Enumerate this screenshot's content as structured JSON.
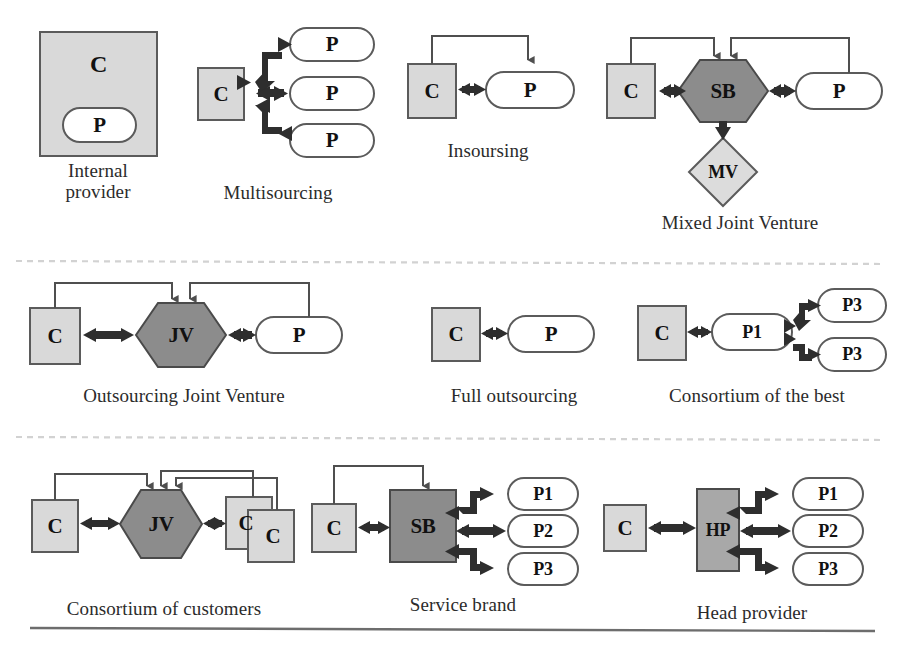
{
  "figure": {
    "title_visible": false,
    "background": "#ffffff",
    "separator_color": "#cfcfcf",
    "rule_color": "#6d6d6d"
  },
  "palette": {
    "customer_fill": "#d9d9d9",
    "provider_fill": "#ffffff",
    "joint_fill": "#8c8c8c",
    "mv_fill": "#dcdcdc",
    "stroke": "#4a4a4a",
    "arrow_thick": "#2e2e2e",
    "arrow_thin": "#5a5a5a",
    "text": "#111111",
    "caption_text": "#2b2b2b"
  },
  "legend": {
    "C": "Customer",
    "P": "Provider",
    "JV": "Joint Venture",
    "SB": "Service Brand",
    "HP": "Head Provider",
    "MV": "Mixed Venture"
  },
  "rows": [
    {
      "id": "row-1",
      "models": [
        {
          "id": "internal-provider",
          "caption": "Internal\nprovider",
          "nodes": [
            {
              "id": "ip-c",
              "label": "C",
              "shape": "square",
              "fill": "customer"
            },
            {
              "id": "ip-p",
              "label": "P",
              "shape": "rounded",
              "fill": "provider"
            }
          ]
        },
        {
          "id": "multisourcing",
          "caption": "Multisourcing",
          "nodes": [
            {
              "id": "ms-c",
              "label": "C",
              "shape": "square",
              "fill": "customer"
            },
            {
              "id": "ms-p1",
              "label": "P",
              "shape": "rounded",
              "fill": "provider"
            },
            {
              "id": "ms-p2",
              "label": "P",
              "shape": "rounded",
              "fill": "provider"
            },
            {
              "id": "ms-p3",
              "label": "P",
              "shape": "rounded",
              "fill": "provider"
            }
          ]
        },
        {
          "id": "insoursing",
          "caption": "Insoursing",
          "nodes": [
            {
              "id": "is-c",
              "label": "C",
              "shape": "square",
              "fill": "customer"
            },
            {
              "id": "is-p",
              "label": "P",
              "shape": "rounded",
              "fill": "provider"
            }
          ]
        },
        {
          "id": "mixed-joint-venture",
          "caption": "Mixed Joint Venture",
          "nodes": [
            {
              "id": "mjv-c",
              "label": "C",
              "shape": "square",
              "fill": "customer"
            },
            {
              "id": "mjv-sb",
              "label": "SB",
              "shape": "hexagon",
              "fill": "joint"
            },
            {
              "id": "mjv-p",
              "label": "P",
              "shape": "rounded",
              "fill": "provider"
            },
            {
              "id": "mjv-mv",
              "label": "MV",
              "shape": "diamond",
              "fill": "mv"
            }
          ]
        }
      ]
    },
    {
      "id": "row-2",
      "models": [
        {
          "id": "outsourcing-joint-venture",
          "caption": "Outsourcing Joint Venture",
          "nodes": [
            {
              "id": "ojv-c",
              "label": "C",
              "shape": "square",
              "fill": "customer"
            },
            {
              "id": "ojv-jv",
              "label": "JV",
              "shape": "hexagon",
              "fill": "joint"
            },
            {
              "id": "ojv-p",
              "label": "P",
              "shape": "rounded",
              "fill": "provider"
            }
          ]
        },
        {
          "id": "full-outsourcing",
          "caption": "Full outsourcing",
          "nodes": [
            {
              "id": "fo-c",
              "label": "C",
              "shape": "square",
              "fill": "customer"
            },
            {
              "id": "fo-p",
              "label": "P",
              "shape": "rounded",
              "fill": "provider"
            }
          ]
        },
        {
          "id": "consortium-of-the-best",
          "caption": "Consortium of the best",
          "nodes": [
            {
              "id": "cb-c",
              "label": "C",
              "shape": "square",
              "fill": "customer"
            },
            {
              "id": "cb-p1",
              "label": "P1",
              "shape": "rounded",
              "fill": "provider"
            },
            {
              "id": "cb-p3a",
              "label": "P3",
              "shape": "rounded",
              "fill": "provider"
            },
            {
              "id": "cb-p3b",
              "label": "P3",
              "shape": "rounded",
              "fill": "provider"
            }
          ]
        }
      ]
    },
    {
      "id": "row-3",
      "models": [
        {
          "id": "consortium-of-customers",
          "caption": "Consortium of customers",
          "nodes": [
            {
              "id": "cc-c1",
              "label": "C",
              "shape": "square",
              "fill": "customer"
            },
            {
              "id": "cc-jv",
              "label": "JV",
              "shape": "hexagon",
              "fill": "joint"
            },
            {
              "id": "cc-c2",
              "label": "C",
              "shape": "square",
              "fill": "customer"
            },
            {
              "id": "cc-c3",
              "label": "C",
              "shape": "square",
              "fill": "customer"
            }
          ]
        },
        {
          "id": "service-brand",
          "caption": "Service brand",
          "nodes": [
            {
              "id": "sb-c",
              "label": "C",
              "shape": "square",
              "fill": "customer"
            },
            {
              "id": "sb-sb",
              "label": "SB",
              "shape": "square",
              "fill": "joint"
            },
            {
              "id": "sb-p1",
              "label": "P1",
              "shape": "rounded",
              "fill": "provider"
            },
            {
              "id": "sb-p2",
              "label": "P2",
              "shape": "rounded",
              "fill": "provider"
            },
            {
              "id": "sb-p3",
              "label": "P3",
              "shape": "rounded",
              "fill": "provider"
            }
          ]
        },
        {
          "id": "head-provider",
          "caption": "Head provider",
          "nodes": [
            {
              "id": "hp-c",
              "label": "C",
              "shape": "square",
              "fill": "customer"
            },
            {
              "id": "hp-hp",
              "label": "HP",
              "shape": "square",
              "fill": "joint"
            },
            {
              "id": "hp-p1",
              "label": "P1",
              "shape": "rounded",
              "fill": "provider"
            },
            {
              "id": "hp-p2",
              "label": "P2",
              "shape": "rounded",
              "fill": "provider"
            },
            {
              "id": "hp-p3",
              "label": "P3",
              "shape": "rounded",
              "fill": "provider"
            }
          ]
        }
      ]
    }
  ]
}
